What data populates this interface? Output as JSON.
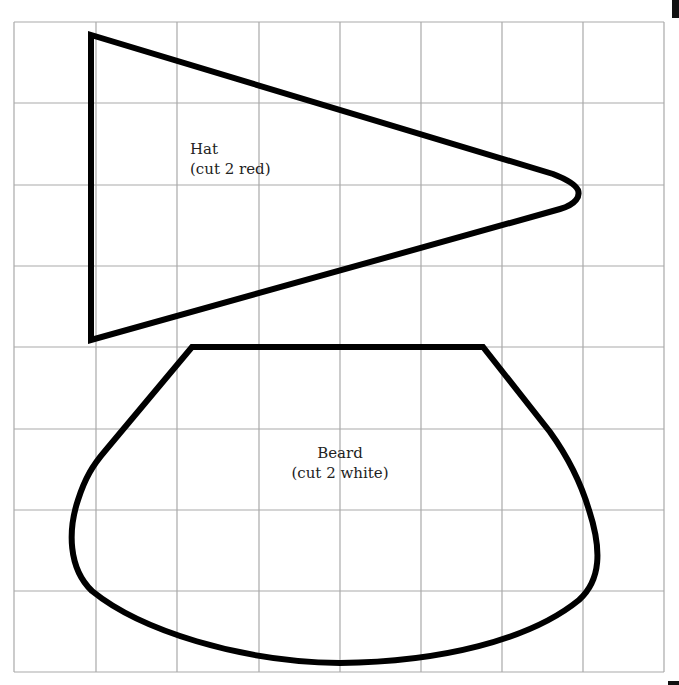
{
  "pattern": {
    "grid": {
      "columns": 8,
      "rows": 8,
      "line_color": "#a9a9a9"
    },
    "pieces": [
      {
        "name": "Hat",
        "instruction": "(cut 2 red)",
        "shape": "triangle"
      },
      {
        "name": "Beard",
        "instruction": "(cut 2 white)",
        "shape": "rounded-trapezoid"
      }
    ],
    "outline_color": "#000000"
  }
}
